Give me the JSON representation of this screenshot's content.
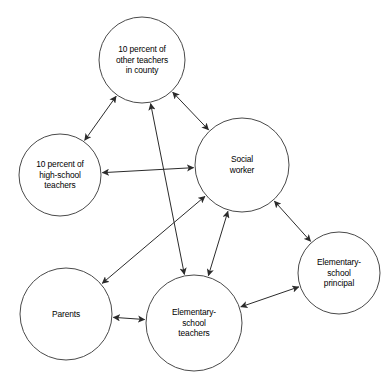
{
  "diagram": {
    "type": "sociogram",
    "title": "",
    "background_color": "#ffffff",
    "node_stroke_color": "#4a4a4a",
    "edge_color": "#2b2b2b",
    "label_color": "#000000",
    "nodes": [
      {
        "id": "other-teachers",
        "label": "10 percent of\nother teachers\nin county",
        "cx": 142,
        "cy": 60,
        "r": 43
      },
      {
        "id": "high-school-teachers",
        "label": "10 percent of\nhigh-school\nteachers",
        "cx": 60,
        "cy": 175,
        "r": 41
      },
      {
        "id": "social-worker",
        "label": "Social\nworker",
        "cx": 242,
        "cy": 165,
        "r": 47
      },
      {
        "id": "parents",
        "label": "Parents",
        "cx": 66,
        "cy": 314,
        "r": 46
      },
      {
        "id": "elementary-school-teachers",
        "label": "Elementary-\nschool\nteachers",
        "cx": 194,
        "cy": 323,
        "r": 48
      },
      {
        "id": "elementary-school-principal",
        "label": "Elementary-\nschool\nprincipal",
        "cx": 339,
        "cy": 273,
        "r": 41
      }
    ],
    "edges": [
      {
        "id": "edge-other-teachers-high-school",
        "from": "other-teachers",
        "to": "high-school-teachers",
        "direction": "both"
      },
      {
        "id": "edge-other-teachers-social-worker",
        "from": "other-teachers",
        "to": "social-worker",
        "direction": "both"
      },
      {
        "id": "edge-other-teachers-elementary-teachers",
        "from": "other-teachers",
        "to": "elementary-school-teachers",
        "direction": "both"
      },
      {
        "id": "edge-high-school-social-worker",
        "from": "high-school-teachers",
        "to": "social-worker",
        "direction": "both"
      },
      {
        "id": "edge-social-worker-parents",
        "from": "social-worker",
        "to": "parents",
        "direction": "both"
      },
      {
        "id": "edge-social-worker-elementary-teachers",
        "from": "social-worker",
        "to": "elementary-school-teachers",
        "direction": "both"
      },
      {
        "id": "edge-social-worker-principal",
        "from": "social-worker",
        "to": "elementary-school-principal",
        "direction": "both"
      },
      {
        "id": "edge-parents-elementary-teachers",
        "from": "parents",
        "to": "elementary-school-teachers",
        "direction": "both"
      },
      {
        "id": "edge-principal-elementary-teachers",
        "from": "elementary-school-principal",
        "to": "elementary-school-teachers",
        "direction": "both"
      }
    ]
  }
}
